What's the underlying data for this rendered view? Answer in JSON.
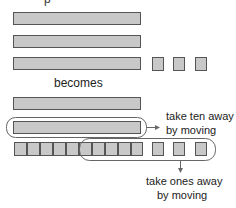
{
  "diagram": {
    "top_fragment": "p",
    "before_label": "becomes",
    "before": {
      "tens_bars": 3,
      "ones_squares": 3
    },
    "after": {
      "tens_bars": 2,
      "ones_squares": 13
    },
    "annotation_tens": {
      "line1": "take ten away",
      "line2": "by moving"
    },
    "annotation_ones": {
      "line1": "take ones away",
      "line2": "by moving"
    },
    "colors": {
      "block_fill": "#c8c8c8",
      "block_border": "#555555",
      "outline": "#666666"
    }
  }
}
